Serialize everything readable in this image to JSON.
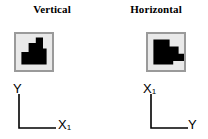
{
  "figure": {
    "background_color": "#ffffff",
    "panels": [
      {
        "id": "vertical",
        "title": "Vertical",
        "shape": {
          "name": "black-staircase-blob",
          "fill_color": "#000000",
          "box_fill_color": "#e9e9e9",
          "box_border_color": "#9a9a9a",
          "orientation": "vertical",
          "polygon_points": "6,34 6,20 14,20 14,10 22,10 22,4 30,4 30,16 34,16 34,34"
        },
        "axes": {
          "vertical_axis_label": "Y",
          "horizontal_axis_label": "X",
          "horizontal_axis_subscript": "1",
          "vertical_axis_subscript": ""
        }
      },
      {
        "id": "horizontal",
        "title": "Horizontal",
        "shape": {
          "name": "black-staircase-blob-rotated",
          "fill_color": "#000000",
          "box_fill_color": "#e9e9e9",
          "box_border_color": "#9a9a9a",
          "orientation": "horizontal",
          "polygon_points": "6,6 24,6 24,14 34,14 34,22 40,22 40,30 28,30 28,34 6,34"
        },
        "axes": {
          "vertical_axis_label": "X",
          "vertical_axis_subscript": "1",
          "horizontal_axis_label": "Y",
          "horizontal_axis_subscript": ""
        }
      }
    ],
    "axis_line_color": "#000000"
  }
}
